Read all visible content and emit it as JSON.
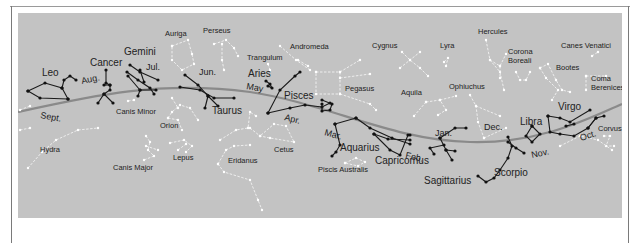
{
  "colors": {
    "panel": "#c3c3c3",
    "ecliptic": "#8a8a8a",
    "zodiac_line": "#1a1a1a",
    "other_line": "#f2f2f2",
    "text": "#222222"
  },
  "ecliptic_path": "M18,112 C90,96 160,80 250,92 C330,104 390,140 470,142 C540,144 590,118 622,104",
  "zodiac_constellations": [
    {
      "name": "Leo",
      "x": 42,
      "y": 76,
      "lines": [
        [
          28,
          91,
          45,
          83,
          62,
          88,
          68,
          99
        ],
        [
          28,
          91,
          40,
          98,
          68,
          99
        ],
        [
          62,
          88,
          64,
          80,
          70,
          76,
          76,
          80
        ]
      ]
    },
    {
      "name": "Cancer",
      "x": 90,
      "y": 66,
      "lines": [
        [
          106,
          70,
          106,
          83,
          110,
          85,
          110,
          90,
          104,
          94,
          98,
          103
        ],
        [
          104,
          94,
          113,
          103
        ],
        [
          104,
          85,
          110,
          85
        ]
      ]
    },
    {
      "name": "Gemini",
      "x": 124,
      "y": 55,
      "lines": [
        [
          130,
          65,
          140,
          72,
          158,
          80
        ],
        [
          127,
          72,
          138,
          80,
          150,
          88,
          154,
          94
        ],
        [
          128,
          76,
          140,
          90,
          156,
          90
        ],
        [
          140,
          70,
          144,
          82
        ],
        [
          140,
          90,
          138,
          96
        ]
      ]
    },
    {
      "name": "Taurus",
      "x": 212,
      "y": 114,
      "lines": [
        [
          180,
          87,
          200,
          90,
          214,
          98,
          234,
          98
        ],
        [
          185,
          75,
          198,
          85,
          208,
          96,
          218,
          106
        ],
        [
          208,
          96,
          205,
          108
        ]
      ]
    },
    {
      "name": "Aries",
      "x": 248,
      "y": 77,
      "lines": [
        [
          266,
          81,
          270,
          84,
          272,
          88,
          268,
          86
        ]
      ]
    },
    {
      "name": "Pisces",
      "x": 284,
      "y": 99,
      "lines": [
        [
          268,
          113,
          280,
          90,
          295,
          76,
          300,
          72
        ],
        [
          268,
          113,
          290,
          108,
          305,
          105,
          322,
          107,
          330,
          103
        ],
        [
          322,
          100,
          332,
          104,
          330,
          110,
          322,
          111,
          322,
          104
        ]
      ]
    },
    {
      "name": "Aquarius",
      "x": 340,
      "y": 151,
      "lines": [
        [
          335,
          124,
          340,
          145,
          336,
          152,
          332,
          156
        ],
        [
          335,
          124,
          356,
          118
        ],
        [
          356,
          118,
          370,
          128,
          392,
          138,
          410,
          144
        ]
      ]
    },
    {
      "name": "Capricornus",
      "x": 375,
      "y": 164,
      "lines": [
        [
          374,
          134,
          388,
          139,
          410,
          140
        ],
        [
          374,
          134,
          390,
          150,
          400,
          155,
          408,
          135,
          410,
          135
        ]
      ]
    },
    {
      "name": "Sagittarius",
      "x": 424,
      "y": 184,
      "lines": [
        [
          440,
          138,
          455,
          128,
          466,
          128
        ],
        [
          440,
          138,
          446,
          150,
          452,
          160
        ],
        [
          446,
          150,
          455,
          151
        ],
        [
          444,
          145,
          430,
          148,
          434,
          154
        ]
      ]
    },
    {
      "name": "Scorpio",
      "x": 494,
      "y": 176,
      "lines": [
        [
          508,
          137,
          512,
          146,
          508,
          158,
          500,
          170,
          494,
          178,
          486,
          182,
          478,
          176
        ],
        [
          508,
          142,
          516,
          148,
          524,
          153
        ]
      ]
    },
    {
      "name": "Libra",
      "x": 520,
      "y": 125,
      "lines": [
        [
          532,
          126,
          526,
          136,
          532,
          142,
          540,
          134,
          532,
          126
        ]
      ]
    },
    {
      "name": "Virgo",
      "x": 558,
      "y": 110,
      "lines": [
        [
          548,
          116,
          560,
          118,
          570,
          122,
          590,
          110
        ],
        [
          548,
          116,
          550,
          132,
          560,
          134,
          574,
          136,
          588,
          128,
          596,
          118
        ],
        [
          588,
          128,
          596,
          118,
          604,
          116
        ],
        [
          566,
          126,
          574,
          124
        ]
      ]
    }
  ],
  "other_constellations": [
    {
      "name": "Canis Minor",
      "x": 116,
      "y": 114,
      "lines": [
        [
          128,
          101,
          134,
          100
        ]
      ]
    },
    {
      "name": "Canis Major",
      "x": 113,
      "y": 170,
      "lines": [
        [
          146,
          136,
          150,
          142,
          148,
          150,
          154,
          156,
          144,
          160
        ],
        [
          146,
          146,
          158,
          150
        ]
      ]
    },
    {
      "name": "Orion",
      "x": 160,
      "y": 128,
      "lines": [
        [
          168,
          118,
          172,
          112,
          180,
          105,
          190,
          108,
          198,
          120
        ],
        [
          168,
          118,
          178,
          120,
          182,
          130
        ],
        [
          172,
          98,
          178,
          108
        ]
      ]
    },
    {
      "name": "Lepus",
      "x": 173,
      "y": 160,
      "lines": [
        [
          170,
          143,
          184,
          140,
          192,
          146,
          186,
          152
        ],
        [
          178,
          150,
          186,
          144
        ]
      ]
    },
    {
      "name": "Hydra",
      "x": 40,
      "y": 152,
      "lines": [
        [
          28,
          168,
          42,
          152,
          56,
          140,
          78,
          130,
          98,
          128
        ],
        [
          20,
          130,
          30,
          128
        ]
      ]
    },
    {
      "name": "Auriga",
      "x": 165,
      "y": 36,
      "lines": [
        [
          172,
          46,
          188,
          40,
          192,
          54,
          194,
          64,
          182,
          70,
          172,
          60,
          172,
          46
        ]
      ]
    },
    {
      "name": "Perseus",
      "x": 203,
      "y": 33,
      "lines": [
        [
          214,
          44,
          226,
          40,
          234,
          48,
          238,
          56
        ],
        [
          222,
          44,
          222,
          60,
          224,
          70
        ]
      ]
    },
    {
      "name": "Trangulum",
      "x": 247,
      "y": 60,
      "lines": [
        [
          268,
          64,
          270,
          70
        ]
      ]
    },
    {
      "name": "Andromeda",
      "x": 290,
      "y": 49,
      "lines": [
        [
          280,
          46,
          296,
          60,
          310,
          70
        ],
        [
          298,
          60,
          308,
          66
        ]
      ]
    },
    {
      "name": "Pegasus",
      "x": 345,
      "y": 91,
      "lines": [
        [
          316,
          72,
          340,
          72,
          340,
          94,
          316,
          94,
          316,
          72
        ],
        [
          340,
          72,
          360,
          60
        ],
        [
          340,
          78,
          370,
          74
        ],
        [
          340,
          94,
          370,
          104,
          376,
          110
        ]
      ]
    },
    {
      "name": "Cetus",
      "x": 274,
      "y": 152,
      "lines": [
        [
          250,
          128,
          260,
          136,
          270,
          138,
          294,
          142,
          286,
          126,
          274,
          124,
          260,
          136
        ]
      ]
    },
    {
      "name": "Eridanus",
      "x": 228,
      "y": 163,
      "lines": [
        [
          220,
          140,
          236,
          130,
          248,
          128,
          250,
          112,
          256,
          116
        ],
        [
          218,
          164,
          226,
          150,
          234,
          146,
          250,
          145
        ],
        [
          218,
          164,
          224,
          172,
          250,
          180,
          258,
          200,
          262,
          210
        ]
      ]
    },
    {
      "name": "Piscis Australis",
      "x": 318,
      "y": 172,
      "lines": [
        [
          345,
          163,
          356,
          158,
          365,
          162,
          358,
          166,
          345,
          163
        ]
      ]
    },
    {
      "name": "Cygnus",
      "x": 372,
      "y": 48,
      "lines": [
        [
          402,
          52,
          410,
          60,
          420,
          68,
          428,
          76
        ],
        [
          400,
          68,
          410,
          60,
          420,
          52
        ]
      ]
    },
    {
      "name": "Lyra",
      "x": 440,
      "y": 48,
      "lines": [
        [
          444,
          62,
          448,
          58,
          446,
          66
        ]
      ]
    },
    {
      "name": "Aquila",
      "x": 401,
      "y": 95,
      "lines": [
        [
          426,
          102,
          440,
          100,
          446,
          110,
          438,
          115
        ],
        [
          426,
          102,
          414,
          116
        ],
        [
          440,
          100,
          456,
          96
        ]
      ]
    },
    {
      "name": "Ophiuchus",
      "x": 449,
      "y": 89,
      "lines": [
        [
          470,
          95,
          476,
          106,
          478,
          122,
          484,
          138
        ],
        [
          484,
          138,
          506,
          128
        ],
        [
          476,
          106,
          500,
          116
        ]
      ]
    },
    {
      "name": "Hercules",
      "x": 478,
      "y": 34,
      "lines": [
        [
          486,
          40,
          490,
          60,
          500,
          72,
          504,
          90
        ],
        [
          490,
          60,
          500,
          66,
          506,
          54
        ],
        [
          500,
          66,
          500,
          78
        ]
      ]
    },
    {
      "name": "Corona Boreali",
      "x": 508,
      "y": 54,
      "lines": [
        [
          516,
          72,
          520,
          80,
          526,
          80,
          530,
          72
        ]
      ]
    },
    {
      "name": "Bootes",
      "x": 556,
      "y": 70,
      "lines": [
        [
          540,
          68,
          548,
          64,
          556,
          80,
          562,
          90,
          570,
          92
        ],
        [
          540,
          68,
          546,
          78,
          558,
          90,
          552,
          100
        ]
      ]
    },
    {
      "name": "Canes Venatici",
      "x": 561,
      "y": 48,
      "lines": [
        [
          592,
          56,
          598,
          52
        ]
      ]
    },
    {
      "name": "Coma Berenices",
      "x": 591,
      "y": 81,
      "lines": [
        [
          586,
          76,
          606,
          76
        ],
        [
          586,
          76,
          586,
          90
        ]
      ]
    },
    {
      "name": "Corvus",
      "x": 598,
      "y": 131,
      "lines": [
        [
          604,
          136,
          610,
          136,
          606,
          146,
          614,
          146
        ]
      ]
    }
  ],
  "extra_lines": [
    {
      "lines": [
        [
          560,
          146,
          580,
          136,
          598,
          140,
          612,
          150
        ]
      ]
    },
    {
      "lines": [
        [
          20,
          110,
          30,
          106
        ]
      ]
    }
  ],
  "months": [
    {
      "label": "Aug.",
      "x": 82,
      "y": 84,
      "rotate": -12
    },
    {
      "label": "Jul.",
      "x": 146,
      "y": 70,
      "rotate": 0
    },
    {
      "label": "Jun.",
      "x": 199,
      "y": 75,
      "rotate": 0
    },
    {
      "label": "May",
      "x": 246,
      "y": 89,
      "rotate": 10
    },
    {
      "label": "Apr.",
      "x": 284,
      "y": 120,
      "rotate": 14
    },
    {
      "label": "Mar.",
      "x": 324,
      "y": 135,
      "rotate": 15
    },
    {
      "label": "Feb.",
      "x": 405,
      "y": 158,
      "rotate": 12
    },
    {
      "label": "Jan.",
      "x": 435,
      "y": 136,
      "rotate": 0
    },
    {
      "label": "Dec.",
      "x": 484,
      "y": 130,
      "rotate": 0
    },
    {
      "label": "Nov.",
      "x": 532,
      "y": 158,
      "rotate": -12
    },
    {
      "label": "Oct.",
      "x": 581,
      "y": 141,
      "rotate": -18
    },
    {
      "label": "Sept.",
      "x": 40,
      "y": 118,
      "rotate": 10
    }
  ]
}
